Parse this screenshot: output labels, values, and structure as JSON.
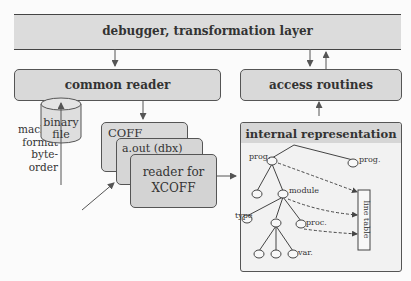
{
  "layers": {
    "top": "debugger, transformation layer",
    "common_reader": "common reader",
    "access_routines": "access routines"
  },
  "side_note": [
    "machine",
    "format",
    "byte-",
    "order"
  ],
  "binary_file": [
    "binary",
    "file"
  ],
  "readers": {
    "coff": "COFF",
    "aout": "a.out (dbx)",
    "xcoff_line1": "reader for",
    "xcoff_line2": "XCOFF"
  },
  "internal": {
    "title": "internal representation",
    "nodes": {
      "prog_left": "prog.",
      "prog_right": "prog.",
      "module": "module",
      "type": "type",
      "proc": "proc.",
      "var": "var."
    },
    "line_table": "line table"
  }
}
